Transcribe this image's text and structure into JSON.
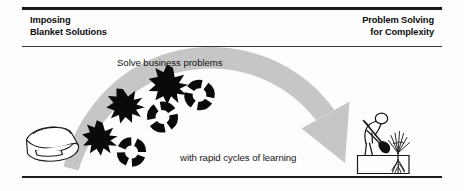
{
  "figure": {
    "title_left": "Imposing\nBlanket Solutions",
    "title_right": "Problem Solving\nfor Complexity",
    "caption_top": "Solve business problems",
    "caption_bottom": "with rapid cycles of learning",
    "colors": {
      "rule": "#1a1a1a",
      "text": "#0d0d0d",
      "arrow": "#c6c6c6",
      "arrow_edge": "#b3b3b3",
      "icon_stroke": "#1a1a1a",
      "icon_fill": "#000000",
      "background": "#fdfdfd"
    },
    "icons": {
      "left": "folded-blanket-icon",
      "right_person": "gardener-digging-icon",
      "right_plant": "plant-with-roots-icon",
      "arrow": "curved-sweep-arrow",
      "burst": "starburst-problem-icon",
      "ring": "iteration-cycle-ring-icon"
    },
    "marks": {
      "burst_count": 3,
      "ring_count": 3,
      "burst_points": 9
    }
  }
}
